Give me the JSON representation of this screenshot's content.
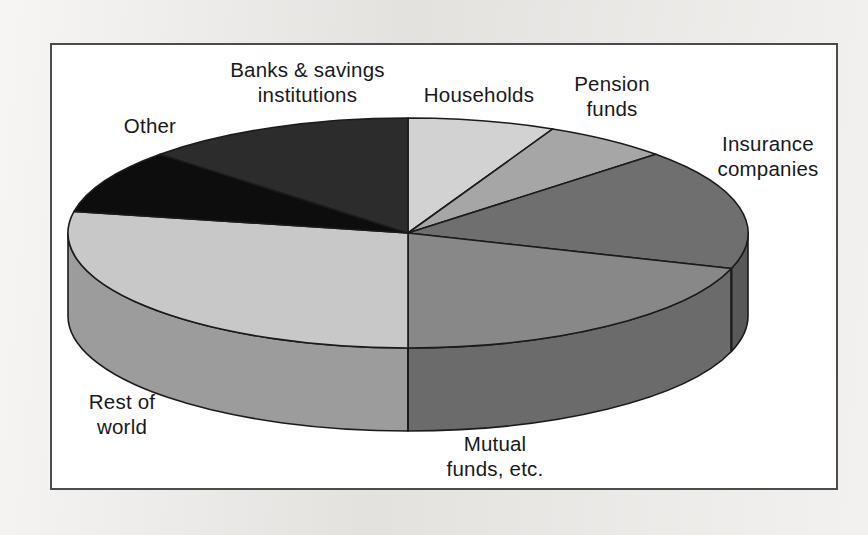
{
  "figure": {
    "background_color": "#eceae7",
    "panel_color": "#ffffff",
    "frame_color": "#4c4c4c"
  },
  "chart_data": {
    "type": "pie",
    "title": "",
    "subtitle": "",
    "xlabel": "",
    "ylabel": "",
    "legend_position": "none",
    "grid": false,
    "three_d": true,
    "start_angle_deg": 0,
    "direction": "clockwise",
    "units": "percent",
    "categories": [
      "Households",
      "Pension funds",
      "Insurance companies",
      "Mutual funds, etc.",
      "Rest of world",
      "Other",
      "Banks & savings institutions"
    ],
    "values": [
      7,
      6,
      17,
      20,
      28,
      9,
      13
    ],
    "slices": [
      {
        "label": "Households",
        "label_lines": [
          "Households"
        ],
        "value": 7,
        "color": "#d2d2d2",
        "side_color": "#a9a9a9",
        "start_deg": 0,
        "end_deg": 25.2
      },
      {
        "label": "Pension funds",
        "label_lines": [
          "Pension",
          "funds"
        ],
        "value": 6,
        "color": "#a6a6a6",
        "side_color": "#858585",
        "start_deg": 25.2,
        "end_deg": 46.8
      },
      {
        "label": "Insurance companies",
        "label_lines": [
          "Insurance",
          "companies"
        ],
        "value": 17,
        "color": "#6f6f6f",
        "side_color": "#585858",
        "start_deg": 46.8,
        "end_deg": 108.0
      },
      {
        "label": "Mutual funds, etc.",
        "label_lines": [
          "Mutual",
          "funds, etc."
        ],
        "value": 20,
        "color": "#888888",
        "side_color": "#6b6b6b",
        "start_deg": 108.0,
        "end_deg": 180.0
      },
      {
        "label": "Rest of world",
        "label_lines": [
          "Rest of",
          "world"
        ],
        "value": 28,
        "color": "#c8c8c8",
        "side_color": "#9c9c9c",
        "start_deg": 180.0,
        "end_deg": 280.8
      },
      {
        "label": "Other",
        "label_lines": [
          "Other"
        ],
        "value": 9,
        "color": "#0d0d0d",
        "side_color": "#0a0a0a",
        "start_deg": 280.8,
        "end_deg": 313.2
      },
      {
        "label": "Banks & savings institutions",
        "label_lines": [
          "Banks & savings",
          "institutions"
        ],
        "value": 13,
        "color": "#2c2c2c",
        "side_color": "#232323",
        "start_deg": 313.2,
        "end_deg": 360.0
      }
    ]
  },
  "labels": {
    "banks_line1": "Banks & savings",
    "banks_line2": "institutions",
    "households": "Households",
    "pension_line1": "Pension",
    "pension_line2": "funds",
    "insurance_line1": "Insurance",
    "insurance_line2": "companies",
    "mutual_line1": "Mutual",
    "mutual_line2": "funds, etc.",
    "rest_line1": "Rest of",
    "rest_line2": "world",
    "other": "Other"
  }
}
